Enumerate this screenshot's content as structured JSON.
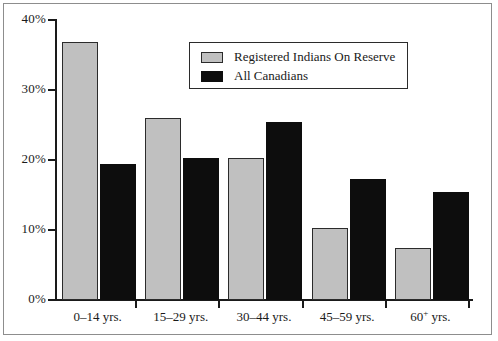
{
  "chart_data": {
    "type": "bar",
    "title": "",
    "subtitle": "",
    "xlabel": "",
    "ylabel": "",
    "categories": [
      "0–14 yrs.",
      "15–29 yrs.",
      "30–44 yrs.",
      "45–59 yrs.",
      "60+ yrs."
    ],
    "category_labels_html": [
      {
        "text": "0–14 yrs.",
        "sup": ""
      },
      {
        "text": "15–29 yrs.",
        "sup": ""
      },
      {
        "text": "30–44 yrs.",
        "sup": ""
      },
      {
        "text": "45–59 yrs.",
        "sup": ""
      },
      {
        "text": "60",
        "sup": "+",
        "tail": " yrs."
      }
    ],
    "series": [
      {
        "name": "Registered Indians On Reserve",
        "color": "#c0c0c0",
        "values": [
          36.8,
          26.0,
          20.3,
          10.3,
          7.4
        ]
      },
      {
        "name": "All Canadians",
        "color": "#0d0d0d",
        "values": [
          19.4,
          20.3,
          25.4,
          17.3,
          15.4
        ]
      }
    ],
    "ylim": [
      0,
      40
    ],
    "ytick_values": [
      0,
      10,
      20,
      30,
      40
    ],
    "ytick_labels": [
      "0%",
      "10%",
      "20%",
      "30%",
      "40%"
    ],
    "grid": false,
    "legend_position": "upper-center"
  },
  "legend": {
    "entries": [
      {
        "label": "Registered Indians On Reserve",
        "swatch": "gray-swatch"
      },
      {
        "label": "All Canadians",
        "swatch": "black-swatch"
      }
    ]
  },
  "axes": {
    "y_labels": [
      "40%",
      "30%",
      "20%",
      "10%",
      "0%"
    ],
    "x_labels": [
      "0–14 yrs.",
      "15–29 yrs.",
      "30–44 yrs.",
      "45–59 yrs.",
      "60+ yrs."
    ]
  }
}
